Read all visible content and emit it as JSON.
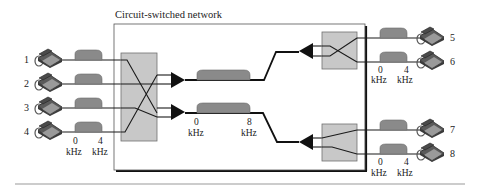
{
  "title": "Circuit-switched network",
  "colors": {
    "line": "#1a1a1a",
    "switch_fill": "#c8c8c8",
    "switch_stroke": "#6e6e6e",
    "hump_fill": "#8a8a8a",
    "phone_fill": "#6a6a6a",
    "rule": "#9a9a9a"
  },
  "left_phones": [
    {
      "id": "1",
      "label": "1"
    },
    {
      "id": "2",
      "label": "2"
    },
    {
      "id": "3",
      "label": "3"
    },
    {
      "id": "4",
      "label": "4"
    }
  ],
  "right_phones": [
    {
      "id": "5",
      "label": "5"
    },
    {
      "id": "6",
      "label": "6"
    },
    {
      "id": "7",
      "label": "7"
    },
    {
      "id": "8",
      "label": "8"
    }
  ],
  "voice_band": {
    "low": "0",
    "high": "4",
    "unit": "kHz"
  },
  "trunk_band": {
    "low": "0",
    "high": "8",
    "unit": "kHz"
  }
}
